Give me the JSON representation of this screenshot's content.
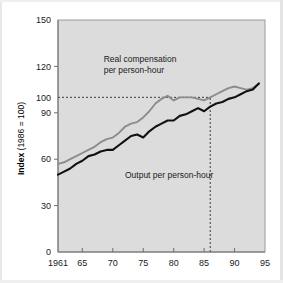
{
  "chart_data": {
    "type": "line",
    "title": "",
    "subtitle": "",
    "xlabel": "",
    "ylabel": "Index (1986 = 100)",
    "ylabel_bold_part": "Index",
    "ylabel_rest": " (1986 = 100)",
    "xlim": [
      1961,
      1995
    ],
    "ylim": [
      0,
      150
    ],
    "grid": false,
    "legend_position": "inline-annotations",
    "x_tick_labels": [
      "1961",
      "65",
      "70",
      "75",
      "80",
      "85",
      "90",
      "95"
    ],
    "x_tick_values": [
      1961,
      1965,
      1970,
      1975,
      1980,
      1985,
      1990,
      1995
    ],
    "y_tick_labels": [
      "0",
      "30",
      "60",
      "90",
      "100",
      "120",
      "150"
    ],
    "y_tick_values": [
      0,
      30,
      60,
      90,
      100,
      120,
      150
    ],
    "reference_lines": [
      {
        "name": "index-100-horizontal",
        "orientation": "horizontal",
        "value": 100,
        "style": "dashed",
        "x_start": 1961,
        "x_end": 1986
      },
      {
        "name": "base-year-1986-vertical",
        "orientation": "vertical",
        "value": 1986,
        "style": "dashed",
        "y_start": 0,
        "y_end": 100
      }
    ],
    "annotations": [
      {
        "name": "real-compensation-label",
        "text": "Real compensation\nper person-hour",
        "line1": "Real compensation",
        "line2": "per person-hour",
        "x": 1968.5,
        "y": 123
      },
      {
        "name": "output-label",
        "text": "Output per person-hour",
        "x": 1972,
        "y": 48
      }
    ],
    "series": [
      {
        "name": "Real compensation per person-hour",
        "color": "#8c8c8c",
        "style": "solid",
        "x": [
          1961,
          1962,
          1963,
          1964,
          1965,
          1966,
          1967,
          1968,
          1969,
          1970,
          1971,
          1972,
          1973,
          1974,
          1975,
          1976,
          1977,
          1978,
          1979,
          1980,
          1981,
          1982,
          1983,
          1984,
          1985,
          1986,
          1987,
          1988,
          1989,
          1990,
          1991,
          1992,
          1993,
          1994
        ],
        "values": [
          57,
          58,
          60,
          62,
          64,
          66,
          68,
          71,
          73,
          74,
          77,
          81,
          83,
          84,
          87,
          91,
          96,
          99,
          101,
          98,
          100,
          100,
          100,
          99,
          98,
          100,
          102,
          104,
          106,
          107,
          106,
          105,
          106,
          109
        ]
      },
      {
        "name": "Output per person-hour",
        "color": "#111111",
        "style": "solid",
        "x": [
          1961,
          1962,
          1963,
          1964,
          1965,
          1966,
          1967,
          1968,
          1969,
          1970,
          1971,
          1972,
          1973,
          1974,
          1975,
          1976,
          1977,
          1978,
          1979,
          1980,
          1981,
          1982,
          1983,
          1984,
          1985,
          1986,
          1987,
          1988,
          1989,
          1990,
          1991,
          1992,
          1993,
          1994
        ],
        "values": [
          50,
          52,
          54,
          57,
          59,
          62,
          63,
          65,
          66,
          66,
          69,
          72,
          75,
          76,
          74,
          78,
          81,
          83,
          85,
          85,
          88,
          89,
          91,
          93,
          91,
          94,
          96,
          97,
          99,
          100,
          102,
          104,
          105,
          109
        ]
      }
    ]
  },
  "axis_title": {
    "bold": "Index",
    "rest": " (1986 = 100)"
  },
  "colors": {
    "plot_background": "#dcdcdc",
    "page_background": "#ffffff",
    "axis": "#6e6e6e",
    "text": "#1a1a1a",
    "series_gray": "#8c8c8c",
    "series_black": "#111111",
    "reference_line": "#3a3a3a"
  }
}
